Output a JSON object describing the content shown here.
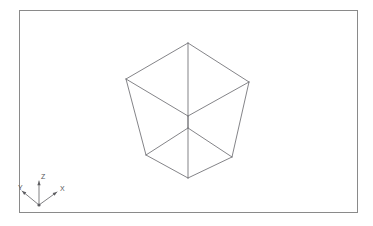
{
  "viewport": {
    "title": "3D Wireframe Viewport",
    "background_color": "#ffffff",
    "frame_color": "#8a8a8a",
    "frame": {
      "x": 19,
      "y": 10,
      "width": 338,
      "height": 202
    }
  },
  "axis_triad": {
    "name": "coordinate-axis-indicator",
    "origin": {
      "x": 39,
      "y": 205
    },
    "line_color": "#6a6a6e",
    "axes": [
      {
        "id": "z",
        "label": "Z",
        "tip": {
          "x": 39,
          "y": 181
        },
        "label_pos": {
          "x": 41,
          "y": 177
        }
      },
      {
        "id": "x",
        "label": "X",
        "tip": {
          "x": 57,
          "y": 192
        },
        "label_pos": {
          "x": 60,
          "y": 189
        }
      },
      {
        "id": "y",
        "label": "Y",
        "tip": {
          "x": 22,
          "y": 191
        },
        "label_pos": {
          "x": 18,
          "y": 188
        }
      }
    ]
  },
  "chart_data": {
    "type": "scatter",
    "xlabel": "",
    "ylabel": "",
    "projection": "perspective",
    "shape": "cube",
    "edge_color": "#6e6e72",
    "vertices": {
      "top_apex": {
        "x": 188,
        "y": 43
      },
      "top_left": {
        "x": 126,
        "y": 79
      },
      "top_right": {
        "x": 249,
        "y": 82
      },
      "top_back_center": {
        "x": 188,
        "y": 116
      },
      "bot_apex": {
        "x": 188,
        "y": 178
      },
      "bot_left": {
        "x": 146,
        "y": 155
      },
      "bot_right": {
        "x": 232,
        "y": 157
      },
      "bot_front_center": {
        "x": 188,
        "y": 128
      }
    },
    "edges": [
      [
        "top_apex",
        "top_left"
      ],
      [
        "top_apex",
        "top_right"
      ],
      [
        "top_left",
        "top_back_center"
      ],
      [
        "top_right",
        "top_back_center"
      ],
      [
        "bot_apex",
        "bot_left"
      ],
      [
        "bot_apex",
        "bot_right"
      ],
      [
        "bot_left",
        "bot_front_center"
      ],
      [
        "bot_right",
        "bot_front_center"
      ],
      [
        "top_apex",
        "bot_apex"
      ],
      [
        "top_left",
        "bot_left"
      ],
      [
        "top_right",
        "bot_right"
      ],
      [
        "top_back_center",
        "bot_front_center"
      ]
    ]
  }
}
